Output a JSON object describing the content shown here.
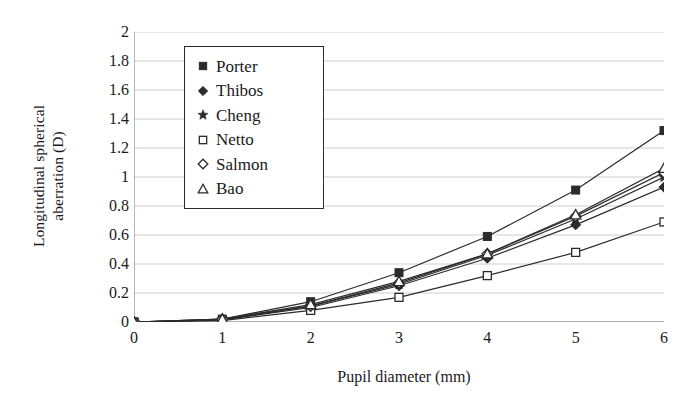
{
  "chart_data": {
    "type": "line",
    "title": "",
    "xlabel": "Pupil diameter (mm)",
    "ylabel": "Longitudinal spherical aberration (D)",
    "ylabel_line1": "Longitudinal spherical",
    "ylabel_line2": "aberration (D)",
    "x": [
      0,
      1,
      2,
      3,
      4,
      5,
      6
    ],
    "xlim": [
      0,
      6
    ],
    "ylim": [
      0,
      2
    ],
    "xticks": [
      "0",
      "1",
      "2",
      "3",
      "4",
      "5",
      "6"
    ],
    "yticks": [
      "0",
      "0.2",
      "0.4",
      "0.6",
      "0.8",
      "1",
      "1.2",
      "1.4",
      "1.6",
      "1.8",
      "2"
    ],
    "ytick_values": [
      0,
      0.2,
      0.4,
      0.6,
      0.8,
      1,
      1.2,
      1.4,
      1.6,
      1.8,
      2
    ],
    "grid": "horizontal",
    "legend_position": "upper-left-inside",
    "line_color": "#2b2b2b",
    "grid_color": "#c8c8c8",
    "axis_color": "#808080",
    "series": [
      {
        "name": "Porter",
        "marker": "filled-square",
        "values": [
          0,
          0.02,
          0.14,
          0.34,
          0.59,
          0.91,
          1.32
        ]
      },
      {
        "name": "Thibos",
        "marker": "filled-diamond",
        "values": [
          0,
          0.015,
          0.1,
          0.25,
          0.44,
          0.67,
          0.93
        ]
      },
      {
        "name": "Cheng",
        "marker": "filled-star",
        "values": [
          0,
          0.015,
          0.11,
          0.26,
          0.46,
          0.71,
          1.0
        ]
      },
      {
        "name": "Netto",
        "marker": "open-square",
        "values": [
          0,
          0.01,
          0.08,
          0.17,
          0.32,
          0.48,
          0.69
        ]
      },
      {
        "name": "Salmon",
        "marker": "open-diamond",
        "values": [
          0,
          0.02,
          0.11,
          0.27,
          0.47,
          0.73,
          1.03
        ]
      },
      {
        "name": "Bao",
        "marker": "open-triangle",
        "values": [
          0,
          0.02,
          0.12,
          0.28,
          0.47,
          0.74,
          1.06
        ]
      }
    ]
  },
  "legend": {
    "items": [
      {
        "label": "Porter",
        "marker": "filled-square"
      },
      {
        "label": "Thibos",
        "marker": "filled-diamond"
      },
      {
        "label": "Cheng",
        "marker": "filled-star"
      },
      {
        "label": "Netto",
        "marker": "open-square"
      },
      {
        "label": "Salmon",
        "marker": "open-diamond"
      },
      {
        "label": "Bao",
        "marker": "open-triangle"
      }
    ]
  }
}
